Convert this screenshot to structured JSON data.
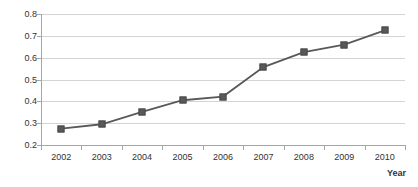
{
  "chart_data": {
    "type": "line",
    "title": "",
    "xlabel": "Year",
    "ylabel": "",
    "categories": [
      "2002",
      "2003",
      "2004",
      "2005",
      "2006",
      "2007",
      "2008",
      "2009",
      "2010"
    ],
    "values": [
      0.275,
      0.295,
      0.352,
      0.405,
      0.422,
      0.557,
      0.625,
      0.66,
      0.725
    ],
    "series": [
      {
        "name": "series-1",
        "values": [
          0.275,
          0.295,
          0.352,
          0.405,
          0.422,
          0.557,
          0.625,
          0.66,
          0.725
        ]
      }
    ],
    "ylim": [
      0.2,
      0.8
    ],
    "yticks": [
      "0.2",
      "0.3",
      "0.4",
      "0.5",
      "0.6",
      "0.7",
      "0.8"
    ],
    "ytick_values": [
      0.2,
      0.3,
      0.4,
      0.5,
      0.6,
      0.7,
      0.8
    ],
    "xticks": [
      "2002",
      "2003",
      "2004",
      "2005",
      "2006",
      "2007",
      "2008",
      "2009",
      "2010"
    ],
    "grid": "horizontal",
    "legend": "none",
    "marker": "square",
    "colors": {
      "line": "#595959",
      "marker": "#595959",
      "gridline": "#d4d4d4",
      "axis": "#a6a6a6",
      "text": "#333333",
      "background": "#ffffff"
    }
  }
}
